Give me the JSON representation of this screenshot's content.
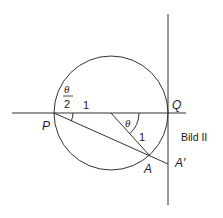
{
  "figure": {
    "caption": "Bild II",
    "points": {
      "P": "P",
      "Q": "Q",
      "A": "A",
      "A_prime": "A′"
    },
    "labels": {
      "half_angle_numerator": "θ",
      "half_angle_denominator": "2",
      "center_angle": "θ",
      "radius_horizontal": "1",
      "radius_slanted": "1"
    },
    "colors": {
      "stroke": "#333333",
      "text": "#1a1a1a",
      "background": "#ffffff"
    }
  }
}
